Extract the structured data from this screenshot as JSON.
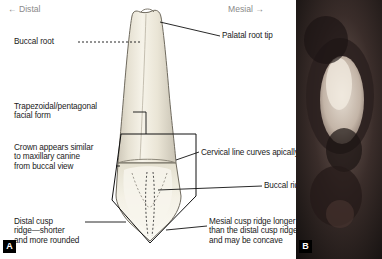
{
  "figure": {
    "direction_left": "← Distal",
    "direction_right": "Mesial →",
    "panel_a": "A",
    "panel_b": "B"
  },
  "labels": {
    "buccal_root": "Buccal root",
    "palatal_root_tip": "Palatal root tip",
    "facial_form": "Trapezoidal/pentagonal\nfacial form",
    "crown_similar": "Crown appears similar\nto maxillary canine\nfrom buccal view",
    "cervical_line": "Cervical line curves apically",
    "buccal_ridge": "Buccal ridge",
    "distal_cusp_ridge": "Distal cusp\nridge—shorter\nand more rounded",
    "mesial_cusp_ridge": "Mesial cusp ridge longer\nthan the distal cusp ridge\nand may be concave"
  },
  "colors": {
    "tooth_fill": "#efeadf",
    "tooth_outline": "#6f6a5e",
    "crown_shade": "#e9e6d7",
    "leader_line": "#000000",
    "direction_text": "#8a8a8a",
    "badge_bg": "#000000",
    "photo_bg": "#1a1a1a"
  }
}
